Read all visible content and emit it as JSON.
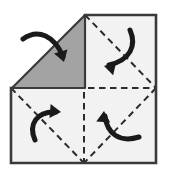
{
  "diagram": {
    "canvas": {
      "width": 169,
      "height": 179
    },
    "colors": {
      "background": "#ffffff",
      "paper_fill": "#f2f2f2",
      "flap_fill": "#a3a3a3",
      "outline": "#3a3a3a",
      "crease": "#2b2b2b",
      "arrow": "#1a1a1a"
    },
    "sheet": {
      "name": "paper-sheet",
      "corners": {
        "top_left": [
          11,
          15
        ],
        "top_right": [
          156,
          15
        ],
        "bottom_right": [
          156,
          163
        ],
        "bottom_left": [
          11,
          163
        ]
      },
      "outline_width": 2.6,
      "visible_outline_path": "M 11 88 L 11 163 L 156 163 L 156 15 L 85 15",
      "body_path": "M 11 88 L 85 15 L 156 15 L 156 163 L 11 163 Z"
    },
    "flap": {
      "name": "folded-grey-flap",
      "shape": "triangle",
      "points": "85,15 12,88 85,88",
      "fill": "#a3a3a3",
      "stroke": "#3a3a3a",
      "stroke_width": 2.2,
      "label": "folded-over quadrant (reverse side)"
    },
    "center_point": [
      84,
      88
    ],
    "bottom_center_point": [
      84,
      163
    ],
    "creases": [
      {
        "name": "crease-horizontal-median",
        "orientation": "horizontal",
        "path": "M 11 88 L 156 88",
        "style": "dashed"
      },
      {
        "name": "crease-vertical-median",
        "orientation": "vertical",
        "path": "M 84 15 L 84 163",
        "style": "dashed"
      },
      {
        "name": "crease-diagonal-top-right",
        "orientation": "diagonal",
        "path": "M 85 15 L 156 88",
        "style": "dashed"
      },
      {
        "name": "crease-diagonal-bottom-left",
        "orientation": "diagonal",
        "path": "M 11 88 L 84 163",
        "style": "dashed"
      },
      {
        "name": "crease-diagonal-bottom-right",
        "orientation": "diagonal",
        "path": "M 156 88 L 84 163",
        "style": "dashed"
      },
      {
        "name": "crease-diagonal-top-left-folded",
        "orientation": "diagonal",
        "path": "M 12 88 L 85 15",
        "style": "fold-edge"
      }
    ],
    "arrows": [
      {
        "name": "arrow-fold-top-left",
        "quadrant": "top-left",
        "direction": "down-right",
        "path": "M 23 39 C 38 28, 55 36, 63 57",
        "head_at": [
          64,
          62
        ],
        "head_angle": 73
      },
      {
        "name": "arrow-fold-top-right",
        "quadrant": "top-right",
        "direction": "down-left",
        "path": "M 130 30 C 137 46, 130 60, 109 65",
        "head_at": [
          104,
          66
        ],
        "head_angle": 193
      },
      {
        "name": "arrow-fold-bottom-left",
        "quadrant": "bottom-left",
        "direction": "up-right",
        "path": "M 35 140 C 28 124, 37 111, 56 112",
        "head_at": [
          61,
          112
        ],
        "head_angle": 5
      },
      {
        "name": "arrow-fold-bottom-right",
        "quadrant": "bottom-right",
        "direction": "up-left",
        "path": "M 139 137 C 120 143, 107 134, 105 116",
        "head_at": [
          104,
          111
        ],
        "head_angle": 274
      }
    ]
  }
}
